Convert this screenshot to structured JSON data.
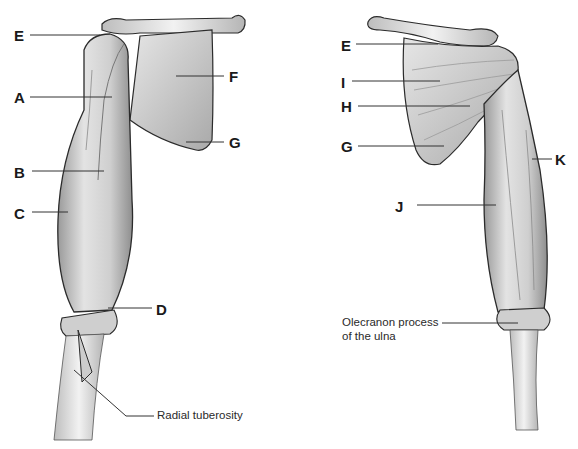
{
  "diagram": {
    "type": "anatomical-illustration",
    "views": [
      {
        "name": "anterior-view",
        "side": "left"
      },
      {
        "name": "posterior-view",
        "side": "right"
      }
    ],
    "left_view": {
      "labels": [
        {
          "id": "E",
          "text": "E",
          "x": 14,
          "y": 28
        },
        {
          "id": "A",
          "text": "A",
          "x": 14,
          "y": 90
        },
        {
          "id": "F",
          "text": "F",
          "x": 229,
          "y": 69
        },
        {
          "id": "G",
          "text": "G",
          "x": 229,
          "y": 135
        },
        {
          "id": "B",
          "text": "B",
          "x": 14,
          "y": 165
        },
        {
          "id": "C",
          "text": "C",
          "x": 14,
          "y": 206
        },
        {
          "id": "D",
          "text": "D",
          "x": 156,
          "y": 302
        }
      ],
      "annotation": {
        "text": "Radial tuberosity",
        "x": 157,
        "y": 406
      }
    },
    "right_view": {
      "labels": [
        {
          "id": "E",
          "text": "E",
          "x": 341,
          "y": 38
        },
        {
          "id": "I",
          "text": "I",
          "x": 341,
          "y": 75
        },
        {
          "id": "H",
          "text": "H",
          "x": 341,
          "y": 99
        },
        {
          "id": "G",
          "text": "G",
          "x": 341,
          "y": 139
        },
        {
          "id": "K",
          "text": "K",
          "x": 555,
          "y": 152
        },
        {
          "id": "J",
          "text": "J",
          "x": 395,
          "y": 199
        }
      ],
      "annotation": {
        "line1": "Olecranon process",
        "line2": "of the ulna",
        "x": 342,
        "y": 318
      }
    },
    "colors": {
      "label": "#1a1a1a",
      "leader": "#333333",
      "muscle": "#d4d4d4",
      "outline": "#2b2b2b"
    }
  }
}
